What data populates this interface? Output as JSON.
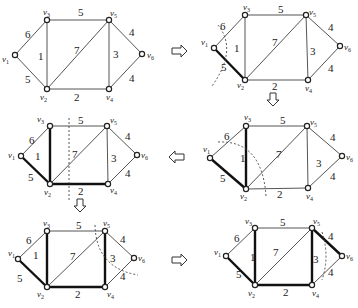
{
  "figure": {
    "vertices": [
      "v1",
      "v2",
      "v3",
      "v4",
      "v5",
      "v6"
    ],
    "vertex_labels": {
      "v1": "v",
      "v2": "v",
      "v3": "v",
      "v4": "v",
      "v5": "v",
      "v6": "v"
    },
    "vertex_subs": {
      "v1": "1",
      "v2": "2",
      "v3": "3",
      "v4": "4",
      "v5": "5",
      "v6": "6"
    },
    "edges": [
      {
        "id": "v1-v3",
        "from": "v1",
        "to": "v3",
        "weight": "6"
      },
      {
        "id": "v1-v2",
        "from": "v1",
        "to": "v2",
        "weight": "5"
      },
      {
        "id": "v3-v2",
        "from": "v3",
        "to": "v2",
        "weight": "1"
      },
      {
        "id": "v3-v5",
        "from": "v3",
        "to": "v5",
        "weight": "5"
      },
      {
        "id": "v2-v5",
        "from": "v2",
        "to": "v5",
        "weight": "7"
      },
      {
        "id": "v2-v4",
        "from": "v2",
        "to": "v4",
        "weight": "2"
      },
      {
        "id": "v5-v4",
        "from": "v5",
        "to": "v4",
        "weight": "3"
      },
      {
        "id": "v5-v6",
        "from": "v5",
        "to": "v6",
        "weight": "4"
      },
      {
        "id": "v4-v6",
        "from": "v4",
        "to": "v6",
        "weight": "4"
      }
    ],
    "steps": [
      {
        "step": 1,
        "position": "top-left",
        "tree_edges": [],
        "cut": false
      },
      {
        "step": 2,
        "position": "top-right",
        "tree_edges": [
          "v1-v2"
        ],
        "cut": true
      },
      {
        "step": 3,
        "position": "middle-right",
        "tree_edges": [
          "v1-v2",
          "v3-v2"
        ],
        "cut": true
      },
      {
        "step": 4,
        "position": "middle-left",
        "tree_edges": [
          "v1-v2",
          "v3-v2",
          "v2-v4"
        ],
        "cut": true
      },
      {
        "step": 5,
        "position": "bottom-left",
        "tree_edges": [
          "v1-v2",
          "v3-v2",
          "v2-v4",
          "v5-v4"
        ],
        "cut": true
      },
      {
        "step": 6,
        "position": "bottom-right",
        "tree_edges": [
          "v1-v2",
          "v3-v2",
          "v2-v4",
          "v5-v4",
          "v5-v6"
        ],
        "cut": true
      }
    ],
    "arrows": [
      {
        "direction": "right",
        "from_step": 1,
        "to_step": 2
      },
      {
        "direction": "down",
        "from_step": 2,
        "to_step": 3
      },
      {
        "direction": "left",
        "from_step": 3,
        "to_step": 4
      },
      {
        "direction": "down",
        "from_step": 4,
        "to_step": 5
      },
      {
        "direction": "right",
        "from_step": 5,
        "to_step": 6
      }
    ]
  }
}
